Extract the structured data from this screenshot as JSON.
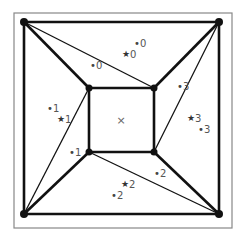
{
  "diagram": {
    "title": "",
    "frame": {
      "x": 14,
      "y": 13,
      "width": 218,
      "height": 215,
      "stroke": "#888888"
    },
    "colors": {
      "edge": "#111111",
      "node": "#111111",
      "label": "#555555",
      "center_mark": "#666666"
    },
    "nodes": [
      {
        "id": "outer-tl",
        "x": 24,
        "y": 22
      },
      {
        "id": "outer-tr",
        "x": 219,
        "y": 22
      },
      {
        "id": "outer-bl",
        "x": 24,
        "y": 214
      },
      {
        "id": "outer-br",
        "x": 219,
        "y": 214
      },
      {
        "id": "inner-tl",
        "x": 89,
        "y": 88
      },
      {
        "id": "inner-tr",
        "x": 154,
        "y": 88
      },
      {
        "id": "inner-bl",
        "x": 89,
        "y": 152
      },
      {
        "id": "inner-br",
        "x": 154,
        "y": 152
      }
    ],
    "thick_edges": [
      [
        "outer-tl",
        "outer-tr"
      ],
      [
        "outer-tr",
        "outer-br"
      ],
      [
        "outer-br",
        "outer-bl"
      ],
      [
        "outer-bl",
        "outer-tl"
      ],
      [
        "inner-tl",
        "inner-tr"
      ],
      [
        "inner-tr",
        "inner-br"
      ],
      [
        "inner-br",
        "inner-bl"
      ],
      [
        "inner-bl",
        "inner-tl"
      ],
      [
        "outer-tl",
        "inner-tl"
      ],
      [
        "outer-tr",
        "inner-tr"
      ],
      [
        "outer-br",
        "inner-br"
      ],
      [
        "outer-bl",
        "inner-bl"
      ]
    ],
    "thin_edges": [
      [
        "outer-tl",
        "inner-tr"
      ],
      [
        "outer-tr",
        "inner-br"
      ],
      [
        "outer-br",
        "inner-bl"
      ],
      [
        "outer-bl",
        "inner-tl"
      ]
    ],
    "center_mark": {
      "symbol": "×",
      "x": 121,
      "y": 120
    },
    "labels": [
      {
        "kind": "dot",
        "text": "0",
        "x": 134,
        "y": 43
      },
      {
        "kind": "star",
        "text": "0",
        "x": 122,
        "y": 54
      },
      {
        "kind": "dot",
        "text": "0",
        "x": 90,
        "y": 65
      },
      {
        "kind": "dot",
        "text": "1",
        "x": 47,
        "y": 108
      },
      {
        "kind": "star",
        "text": "1",
        "x": 57,
        "y": 119
      },
      {
        "kind": "dot",
        "text": "1",
        "x": 69,
        "y": 152
      },
      {
        "kind": "dot",
        "text": "3",
        "x": 177,
        "y": 86
      },
      {
        "kind": "star",
        "text": "3",
        "x": 187,
        "y": 118
      },
      {
        "kind": "dot",
        "text": "3",
        "x": 198,
        "y": 129
      },
      {
        "kind": "dot",
        "text": "2",
        "x": 154,
        "y": 173
      },
      {
        "kind": "star",
        "text": "2",
        "x": 121,
        "y": 184
      },
      {
        "kind": "dot",
        "text": "2",
        "x": 111,
        "y": 195
      }
    ]
  }
}
